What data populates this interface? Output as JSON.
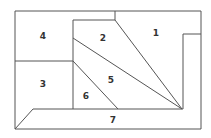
{
  "diagram": {
    "type": "floor-plan-partition",
    "stroke_color": "#555555",
    "background": "#ffffff",
    "regions": [
      {
        "id": "1",
        "label": "1",
        "x": 156,
        "y": 33
      },
      {
        "id": "2",
        "label": "2",
        "x": 103,
        "y": 38
      },
      {
        "id": "3",
        "label": "3",
        "x": 43,
        "y": 84
      },
      {
        "id": "4",
        "label": "4",
        "x": 43,
        "y": 36
      },
      {
        "id": "5",
        "label": "5",
        "x": 111,
        "y": 80
      },
      {
        "id": "6",
        "label": "6",
        "x": 86,
        "y": 96
      },
      {
        "id": "7",
        "label": "7",
        "x": 113,
        "y": 120
      }
    ]
  }
}
